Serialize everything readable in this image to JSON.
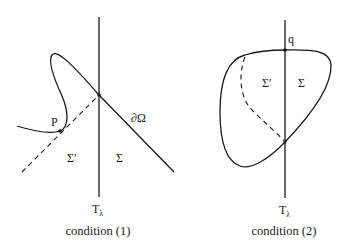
{
  "figure": {
    "panels": [
      {
        "id": "condition-1",
        "caption": "condition (1)",
        "line_label": "T",
        "line_label_subscript": "λ",
        "boundary_label": "∂Ω",
        "point_label": "P",
        "region_left_label": "Σ′",
        "region_right_label": "Σ"
      },
      {
        "id": "condition-2",
        "caption": "condition (2)",
        "line_label": "T",
        "line_label_subscript": "λ",
        "point_label": "q",
        "region_left_label": "Σ′",
        "region_right_label": "Σ"
      }
    ]
  }
}
